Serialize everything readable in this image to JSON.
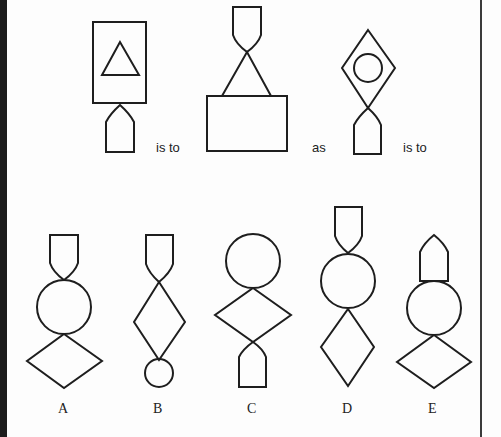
{
  "puzzle": {
    "type": "figural analogy",
    "connectors": {
      "is_to_1": "is to",
      "as": "as",
      "is_to_2": "is to"
    },
    "stem_figures": [
      {
        "id": "fig1",
        "shapes": [
          "rectangle",
          "triangle",
          "pentagon-arrow"
        ]
      },
      {
        "id": "fig2",
        "shapes": [
          "shield",
          "triangle",
          "rectangle"
        ]
      },
      {
        "id": "fig3",
        "shapes": [
          "diamond",
          "circle",
          "pentagon-arrow"
        ]
      }
    ],
    "options": [
      {
        "label": "A",
        "shapes": [
          "shield",
          "circle",
          "diamond"
        ]
      },
      {
        "label": "B",
        "shapes": [
          "shield",
          "diamond",
          "small-circle"
        ]
      },
      {
        "label": "C",
        "shapes": [
          "circle",
          "diamond",
          "pentagon-arrow"
        ]
      },
      {
        "label": "D",
        "shapes": [
          "shield",
          "circle",
          "tall-diamond"
        ]
      },
      {
        "label": "E",
        "shapes": [
          "pentagon-arrow",
          "circle",
          "diamond"
        ]
      }
    ]
  },
  "colors": {
    "stroke": "#1e1e1e",
    "background": "#fdfdfd",
    "left_bar": "#1c1c1c"
  }
}
